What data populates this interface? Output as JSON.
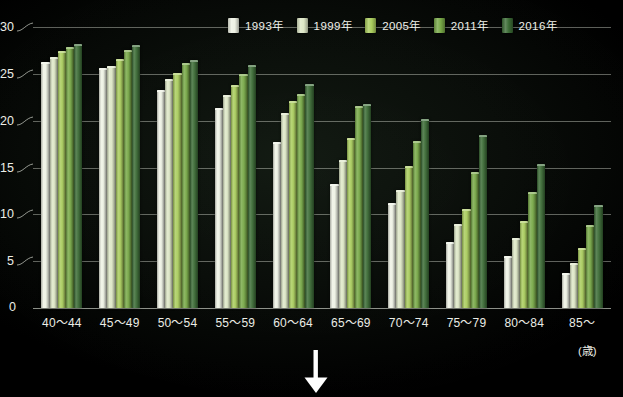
{
  "chart_data": {
    "type": "bar",
    "title": "",
    "xlabel": "(歳)",
    "ylabel": "",
    "ylim": [
      0,
      30
    ],
    "yticks": [
      0,
      5,
      10,
      15,
      20,
      25,
      30
    ],
    "grid": true,
    "legend_position": "top-right",
    "categories": [
      "40〜44",
      "45〜49",
      "50〜54",
      "55〜59",
      "60〜64",
      "65〜69",
      "70〜74",
      "75〜79",
      "80〜84",
      "85〜"
    ],
    "series": [
      {
        "name": "1993年",
        "color": "#eef2e4",
        "values": [
          26.3,
          25.6,
          23.3,
          21.4,
          17.7,
          13.2,
          11.2,
          7.0,
          5.5,
          3.7
        ]
      },
      {
        "name": "1999年",
        "color": "#dde7c6",
        "values": [
          26.8,
          25.8,
          24.5,
          22.7,
          20.8,
          15.8,
          12.6,
          9.0,
          7.5,
          4.8
        ]
      },
      {
        "name": "2005年",
        "color": "#a9cc5c",
        "values": [
          27.4,
          26.6,
          25.1,
          23.8,
          22.1,
          18.2,
          15.2,
          10.6,
          9.3,
          6.4
        ]
      },
      {
        "name": "2011年",
        "color": "#77a846",
        "values": [
          27.9,
          27.5,
          26.2,
          25.0,
          22.8,
          21.6,
          17.8,
          14.5,
          12.4,
          8.9
        ]
      },
      {
        "name": "2016年",
        "color": "#3b6b35",
        "values": [
          28.2,
          28.1,
          26.5,
          25.9,
          23.9,
          21.8,
          20.2,
          18.5,
          15.4,
          11.0
        ]
      }
    ]
  },
  "axis": {
    "zero_label": "0",
    "unit_label": "(歳)"
  },
  "annotation": {
    "arrow": "down-arrow"
  }
}
